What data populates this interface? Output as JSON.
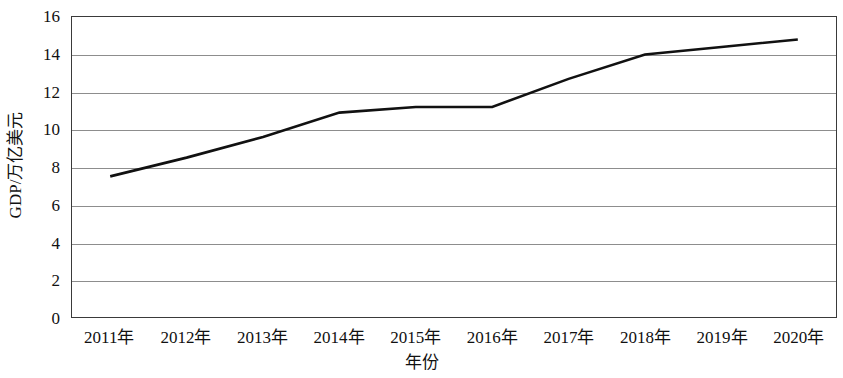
{
  "chart_data": {
    "type": "line",
    "title": "",
    "subtitle": "",
    "xlabel": "年份",
    "ylabel": "GDP/万亿美元",
    "categories": [
      "2011年",
      "2012年",
      "2013年",
      "2014年",
      "2015年",
      "2016年",
      "2017年",
      "2018年",
      "2019年",
      "2020年"
    ],
    "x": [
      2011,
      2012,
      2013,
      2014,
      2015,
      2016,
      2017,
      2018,
      2019,
      2020
    ],
    "values": [
      7.5,
      8.5,
      9.6,
      10.9,
      11.2,
      11.2,
      12.7,
      14.0,
      14.4,
      14.8
    ],
    "series": [
      {
        "name": "GDP",
        "values": [
          7.5,
          8.5,
          9.6,
          10.9,
          11.2,
          11.2,
          12.7,
          14.0,
          14.4,
          14.8
        ]
      }
    ],
    "ylim": [
      0,
      16
    ],
    "ytick_labels": [
      "16",
      "14",
      "12",
      "10",
      "8",
      "6",
      "4",
      "2",
      "0"
    ],
    "yticks": [
      16,
      14,
      12,
      10,
      8,
      6,
      4,
      2,
      0
    ],
    "grid": true,
    "grid_axis": "y",
    "legend": false,
    "legend_position": "none",
    "line_color": "#111111",
    "line_width": 2.6,
    "markers": false,
    "axis_color": "#3a3a3a",
    "gridline_color": "#8d8d8d",
    "background_color": "#ffffff",
    "annotations": []
  }
}
